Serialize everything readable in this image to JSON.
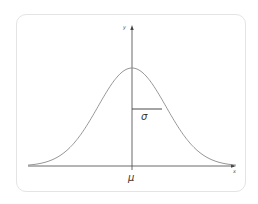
{
  "diagram": {
    "axes": {
      "x_label": "x",
      "y_label": "y"
    },
    "annotations": {
      "mean_label": "μ",
      "std_label": "σ"
    },
    "colors": {
      "curve": "#8a8a8a",
      "axis": "#444444",
      "sigma_line": "#333333",
      "card_border": "#e4e4e4"
    }
  },
  "chart_data": {
    "type": "line",
    "title": "",
    "xlabel": "x",
    "ylabel": "y",
    "series": [
      {
        "name": "normal pdf",
        "x": [
          -3,
          -2,
          -1,
          0,
          1,
          2,
          3
        ],
        "values": [
          0.004,
          0.054,
          0.242,
          0.399,
          0.242,
          0.054,
          0.004
        ]
      }
    ],
    "annotations": [
      "μ",
      "σ"
    ],
    "grid": false
  }
}
